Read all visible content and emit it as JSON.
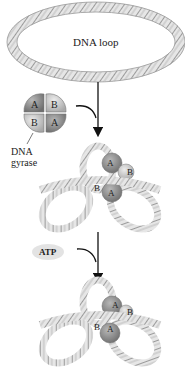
{
  "diagram": {
    "dna_loop_label": "DNA loop",
    "enzyme_label_line1": "DNA",
    "enzyme_label_line2": "gyrase",
    "atp_label": "ATP",
    "subunits": {
      "top_left": "A",
      "top_right": "B",
      "bottom_left": "B",
      "bottom_right": "A"
    },
    "stage2_subunits": [
      "A",
      "B",
      "B",
      "A"
    ],
    "stage3_subunits": [
      "A",
      "B",
      "B",
      "A"
    ],
    "colors": {
      "dna_strand": "#9a9a9a",
      "subunit_dark": "#8c8c8c",
      "subunit_light": "#c8c8c8",
      "arrow": "#111111"
    }
  }
}
